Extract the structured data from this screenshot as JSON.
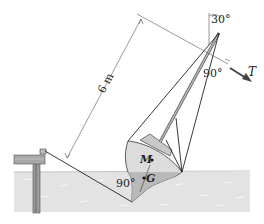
{
  "figure": {
    "labels": {
      "angle_top": "30°",
      "angle_mast": "90°",
      "angle_keel": "90°",
      "force": "T",
      "dimension": "6 m",
      "metacenter": "M",
      "gravity_center": "G"
    },
    "colors": {
      "water": "#e2e2e2",
      "water_dark": "#cfcfcf",
      "hull": "#d8d8d8",
      "hull_submerged": "#b8b8b8",
      "line": "#222222",
      "dim_line": "#555555"
    }
  }
}
